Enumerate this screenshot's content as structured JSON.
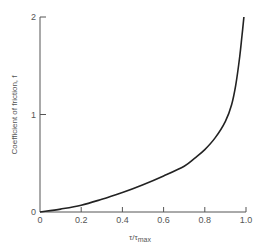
{
  "chart_data": {
    "type": "line",
    "title": "",
    "xlabel": "τ/τmax",
    "xlabel_main": "τ/τ",
    "xlabel_sub": "max",
    "ylabel": "Coefficient of friction, f",
    "xlim": [
      0,
      1.0
    ],
    "ylim": [
      0,
      2
    ],
    "x_ticks": [
      "0",
      "0.2",
      "0.4",
      "0.6",
      "0.8",
      "1.0"
    ],
    "x_tick_values": [
      0,
      0.2,
      0.4,
      0.6,
      0.8,
      1.0
    ],
    "y_ticks": [
      "0",
      "1",
      "2"
    ],
    "y_tick_values": [
      0,
      1,
      2
    ],
    "grid": false,
    "legend": null,
    "series": [
      {
        "name": "f vs τ/τmax",
        "x": [
          0,
          0.1,
          0.2,
          0.3,
          0.4,
          0.5,
          0.6,
          0.7,
          0.75,
          0.8,
          0.85,
          0.9,
          0.93,
          0.95,
          0.97,
          0.98,
          0.99
        ],
        "values": [
          0,
          0.03,
          0.07,
          0.13,
          0.2,
          0.28,
          0.37,
          0.47,
          0.55,
          0.64,
          0.76,
          0.93,
          1.1,
          1.3,
          1.6,
          1.8,
          2.0
        ],
        "color": "#222222"
      }
    ]
  },
  "colors": {
    "axis": "#555555",
    "curve": "#222222",
    "text": "#555555",
    "background": "#ffffff"
  }
}
